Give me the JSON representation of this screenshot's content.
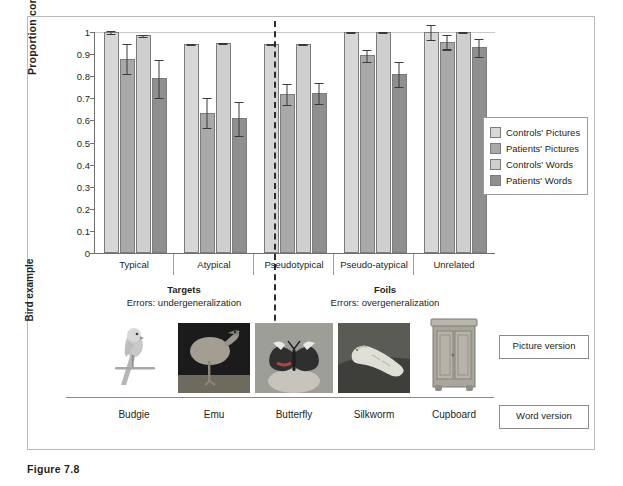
{
  "caption": "Figure 7.8",
  "chart_data": {
    "type": "bar",
    "title": "",
    "xlabel": "",
    "ylabel": "Proportion correct",
    "ylim": [
      0,
      1
    ],
    "yticks": [
      "0",
      "0.1",
      "0.2",
      "0.3",
      "0.4",
      "0.5",
      "0.6",
      "0.7",
      "0.8",
      "0.9",
      "1"
    ],
    "grid": false,
    "legend_position": "right",
    "categories": [
      "Typical",
      "Atypical",
      "Pseudotypical",
      "Pseudo-atypical",
      "Unrelated"
    ],
    "series": [
      {
        "name": "Controls' Pictures",
        "color": "#d7d7d7",
        "values": [
          1.0,
          0.945,
          0.945,
          1.0,
          1.0
        ],
        "errors": [
          0.008,
          0.006,
          0.006,
          0.006,
          0.035
        ]
      },
      {
        "name": "Patients' Pictures",
        "color": "#a9a9a9",
        "values": [
          0.88,
          0.635,
          0.72,
          0.895,
          0.955
        ],
        "errors": [
          0.07,
          0.07,
          0.05,
          0.03,
          0.035
        ]
      },
      {
        "name": "Controls' Words",
        "color": "#cfcfcf",
        "values": [
          0.985,
          0.95,
          0.945,
          1.0,
          1.0
        ],
        "errors": [
          0.008,
          0.006,
          0.006,
          0.006,
          0.006
        ]
      },
      {
        "name": "Patients' Words",
        "color": "#8f8f8f",
        "values": [
          0.79,
          0.61,
          0.725,
          0.81,
          0.93
        ],
        "errors": [
          0.09,
          0.08,
          0.05,
          0.06,
          0.045
        ]
      }
    ],
    "group_divider_after": "Atypical",
    "conditions": [
      {
        "title": "Targets",
        "subtitle": "Errors: undergeneralization"
      },
      {
        "title": "Foils",
        "subtitle": "Errors: overgeneralization"
      }
    ]
  },
  "legend": {
    "items": [
      {
        "label": "Controls' Pictures",
        "color": "#d7d7d7"
      },
      {
        "label": "Patients' Pictures",
        "color": "#a9a9a9"
      },
      {
        "label": "Controls' Words",
        "color": "#cfcfcf"
      },
      {
        "label": "Patients' Words",
        "color": "#8f8f8f"
      }
    ]
  },
  "examples": {
    "row_label": "Bird example",
    "items": [
      {
        "word": "Budgie",
        "image": "budgie-photo"
      },
      {
        "word": "Emu",
        "image": "emu-photo"
      },
      {
        "word": "Butterfly",
        "image": "butterfly-photo"
      },
      {
        "word": "Silkworm",
        "image": "silkworm-photo"
      },
      {
        "word": "Cupboard",
        "image": "cupboard-photo"
      }
    ],
    "picture_version_label": "Picture version",
    "word_version_label": "Word version"
  }
}
